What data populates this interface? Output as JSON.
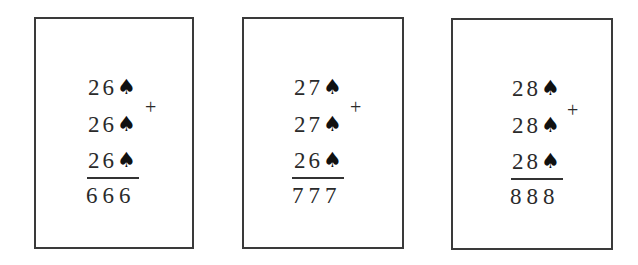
{
  "cards": [
    {
      "addends": [
        {
          "digits": "26",
          "suit": "♠"
        },
        {
          "digits": "26",
          "suit": "♠"
        },
        {
          "digits": "26",
          "suit": "♠"
        }
      ],
      "operator": "+",
      "sum": "666"
    },
    {
      "addends": [
        {
          "digits": "27",
          "suit": "♠"
        },
        {
          "digits": "27",
          "suit": "♠"
        },
        {
          "digits": "26",
          "suit": "♠"
        }
      ],
      "operator": "+",
      "sum": "777"
    },
    {
      "addends": [
        {
          "digits": "28",
          "suit": "♠"
        },
        {
          "digits": "28",
          "suit": "♠"
        },
        {
          "digits": "28",
          "suit": "♠"
        }
      ],
      "operator": "+",
      "sum": "888"
    }
  ]
}
